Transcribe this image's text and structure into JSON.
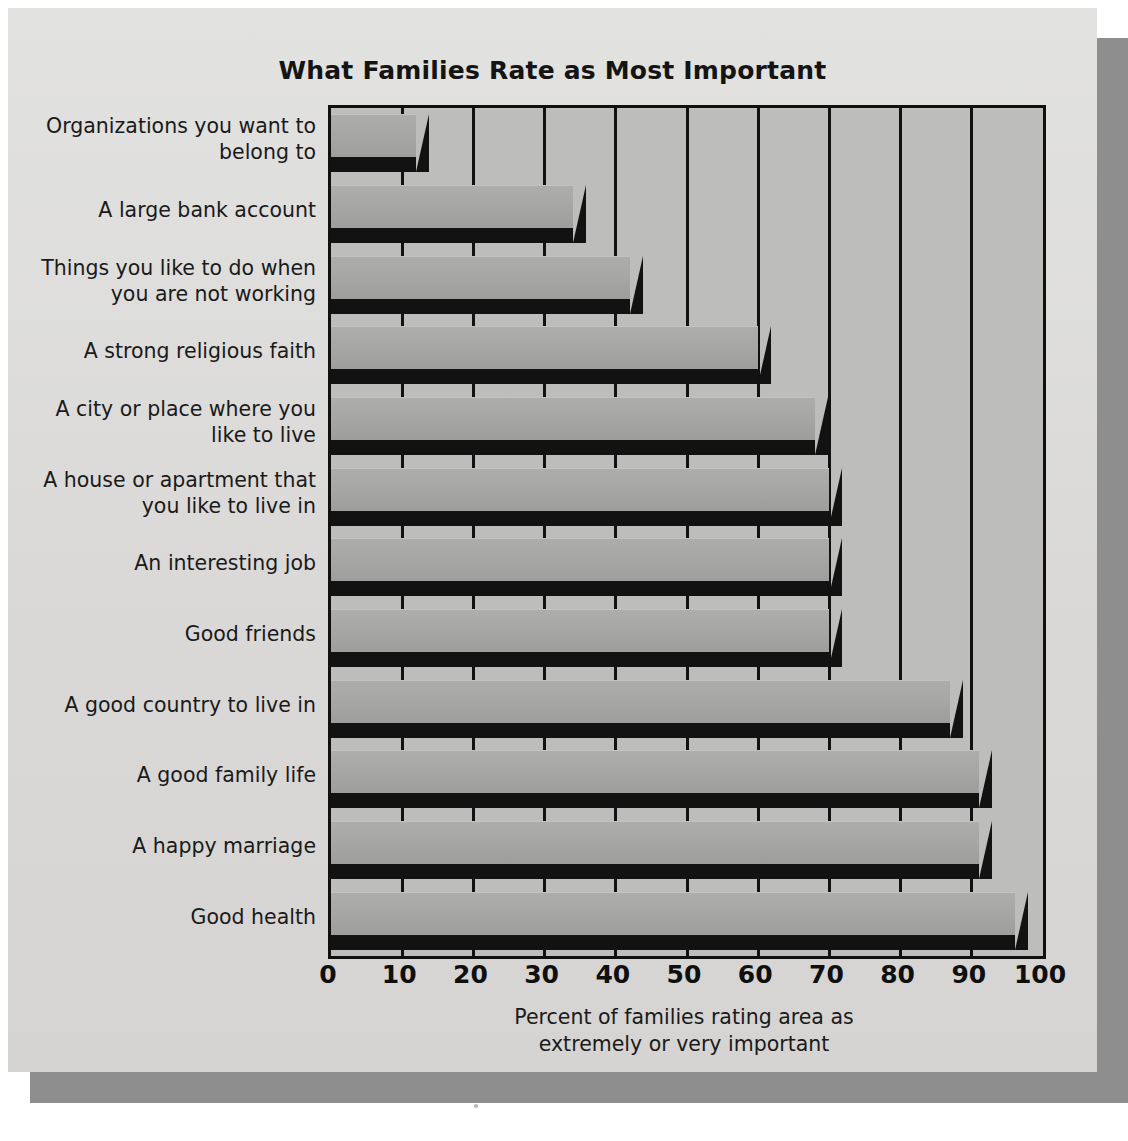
{
  "chart_data": {
    "type": "bar",
    "orientation": "horizontal",
    "title": "What Families Rate as Most Important",
    "xlabel": "Percent of families rating area as extremely or very important",
    "ylabel": "",
    "xlim": [
      0,
      100
    ],
    "xticks": [
      0,
      10,
      20,
      30,
      40,
      50,
      60,
      70,
      80,
      90,
      100
    ],
    "grid": "vertical",
    "legend": "none",
    "categories": [
      "Organizations you want to belong to",
      "A large bank account",
      "Things you like to do when you are not working",
      "A strong religious faith",
      "A city or place where you like to live",
      "A house or apartment that you like to live in",
      "An interesting job",
      "Good friends",
      "A good country to live in",
      "A good family life",
      "A happy marriage",
      "Good health"
    ],
    "values": [
      12,
      34,
      42,
      60,
      68,
      70,
      70,
      70,
      87,
      91,
      91,
      96
    ]
  },
  "chart": {
    "title": "What Families Rate as Most Important",
    "axis_caption_line1": "Percent of families rating area as",
    "axis_caption_line2": "extremely or very important",
    "category_labels": [
      {
        "line1": "Organizations you want to",
        "line2": "belong to"
      },
      {
        "line1": "A large bank account",
        "line2": ""
      },
      {
        "line1": "Things you like to do when",
        "line2": "you are not working"
      },
      {
        "line1": "A strong religious faith",
        "line2": ""
      },
      {
        "line1": "A city or place where you",
        "line2": "like to live"
      },
      {
        "line1": "A house or apartment that",
        "line2": "you like to live in"
      },
      {
        "line1": "An interesting job",
        "line2": ""
      },
      {
        "line1": "Good friends",
        "line2": ""
      },
      {
        "line1": "A good country to live in",
        "line2": ""
      },
      {
        "line1": "A good family life",
        "line2": ""
      },
      {
        "line1": "A happy marriage",
        "line2": ""
      },
      {
        "line1": "Good health",
        "line2": ""
      }
    ],
    "xtick_labels": [
      "0",
      "10",
      "20",
      "30",
      "40",
      "50",
      "60",
      "70",
      "80",
      "90",
      "100"
    ],
    "colors": {
      "page_background": "#ffffff",
      "panel_background": "#dcdcda",
      "panel_shadow": "#8e8e8e",
      "plot_background": "#bdbdbb",
      "bar_fill": "#a6a6a4",
      "bar_shadow": "#121212",
      "axis": "#101010",
      "text": "#1a1a1a"
    }
  }
}
